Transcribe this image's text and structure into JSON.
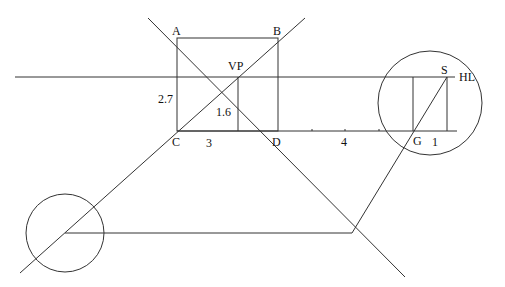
{
  "diagram": {
    "stroke_color": "#333333",
    "labels": {
      "A": "A",
      "B": "B",
      "C": "C",
      "D": "D",
      "VP": "VP",
      "S": "S",
      "G": "G",
      "HL": "HL",
      "height_left": "2.7",
      "height_vp": "1.6",
      "dist_cd": "3",
      "dist_dg": "4",
      "dist_g1": "1"
    }
  }
}
